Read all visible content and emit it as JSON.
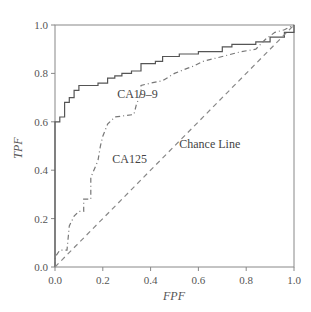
{
  "chart_data": {
    "type": "line",
    "title": "",
    "xlabel": "FPF",
    "ylabel": "TPF",
    "xlim": [
      0.0,
      1.0
    ],
    "ylim": [
      0.0,
      1.0
    ],
    "xticks": [
      "0.0",
      "0.2",
      "0.4",
      "0.6",
      "0.8",
      "1.0"
    ],
    "yticks": [
      "0.0",
      "0.2",
      "0.4",
      "0.6",
      "0.8",
      "1.0"
    ],
    "grid": false,
    "legend": "none (inline annotations)",
    "annotations": [
      {
        "text": "CA19–9",
        "x": 0.26,
        "y": 0.7
      },
      {
        "text": "CA125",
        "x": 0.24,
        "y": 0.43
      },
      {
        "text": "Chance Line",
        "x": 0.52,
        "y": 0.49
      }
    ],
    "series": [
      {
        "name": "CA19–9",
        "style": "solid",
        "color": "#555555",
        "x": [
          0.0,
          0.0,
          0.02,
          0.02,
          0.04,
          0.04,
          0.06,
          0.06,
          0.08,
          0.08,
          0.1,
          0.1,
          0.18,
          0.18,
          0.22,
          0.22,
          0.25,
          0.25,
          0.28,
          0.28,
          0.32,
          0.32,
          0.36,
          0.36,
          0.42,
          0.42,
          0.45,
          0.45,
          0.52,
          0.52,
          0.6,
          0.6,
          0.7,
          0.7,
          0.74,
          0.74,
          0.84,
          0.84,
          0.9,
          0.9,
          0.96,
          0.96,
          1.0,
          1.0
        ],
        "y": [
          0.0,
          0.6,
          0.6,
          0.62,
          0.62,
          0.68,
          0.68,
          0.7,
          0.7,
          0.73,
          0.73,
          0.75,
          0.75,
          0.76,
          0.76,
          0.78,
          0.78,
          0.79,
          0.79,
          0.8,
          0.8,
          0.81,
          0.81,
          0.84,
          0.84,
          0.85,
          0.85,
          0.87,
          0.87,
          0.88,
          0.88,
          0.89,
          0.89,
          0.91,
          0.91,
          0.92,
          0.92,
          0.93,
          0.93,
          0.95,
          0.95,
          0.97,
          0.97,
          1.0
        ]
      },
      {
        "name": "CA125",
        "style": "dashdot",
        "color": "#777777",
        "x": [
          0.0,
          0.0,
          0.02,
          0.05,
          0.06,
          0.08,
          0.1,
          0.12,
          0.12,
          0.15,
          0.15,
          0.18,
          0.19,
          0.2,
          0.22,
          0.25,
          0.33,
          0.34,
          0.36,
          0.36,
          0.4,
          0.45,
          0.5,
          0.55,
          0.58,
          0.62,
          0.7,
          0.78,
          0.84,
          0.88,
          0.92,
          0.96,
          1.0
        ],
        "y": [
          0.0,
          0.04,
          0.07,
          0.07,
          0.17,
          0.21,
          0.23,
          0.23,
          0.28,
          0.28,
          0.37,
          0.44,
          0.5,
          0.54,
          0.59,
          0.62,
          0.63,
          0.67,
          0.72,
          0.75,
          0.76,
          0.77,
          0.8,
          0.82,
          0.83,
          0.85,
          0.87,
          0.89,
          0.9,
          0.94,
          0.97,
          0.98,
          1.0
        ]
      },
      {
        "name": "Chance Line",
        "style": "dashed",
        "color": "#888888",
        "x": [
          0.0,
          1.0
        ],
        "y": [
          0.0,
          1.0
        ]
      }
    ]
  }
}
